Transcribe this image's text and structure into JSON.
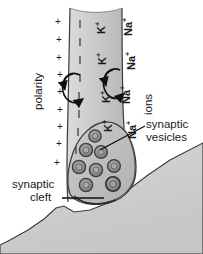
{
  "figure": {
    "type": "biological-diagram"
  },
  "colors": {
    "background": "#ffffff",
    "axon_fill": "#c9c9c9",
    "axon_fill_light": "#e2e2e2",
    "terminal_fill": "#bdbdbd",
    "postsynaptic_fill": "#cfcfcf",
    "outline": "#3a3a3a",
    "vesicle_ring": "#4a4a4a",
    "vesicle_core": "#9a9a9a",
    "text": "#1a1a1a",
    "arrow": "#111111"
  },
  "labels": {
    "polarity": "polarity",
    "ions": "ions",
    "synaptic_vesicles_line1": "synaptic",
    "synaptic_vesicles_line2": "vesicles",
    "synaptic_cleft_line1": "synaptic",
    "synaptic_cleft_line2": "cleft"
  },
  "ion_labels": [
    {
      "base": "K",
      "charge": "+"
    },
    {
      "base": "Na",
      "charge": "+"
    },
    {
      "base": "K",
      "charge": "+"
    },
    {
      "base": "Na",
      "charge": "+"
    },
    {
      "base": "K",
      "charge": "+"
    },
    {
      "base": "Na",
      "charge": "+"
    },
    {
      "base": "K",
      "charge": "+"
    },
    {
      "base": "Na",
      "charge": "+"
    }
  ],
  "ion_text": {
    "k": "K",
    "na": "Na",
    "plus": "+"
  },
  "charges": {
    "outside_symbol": "+",
    "inside_symbol": "|",
    "outside_count": 9,
    "inside_count": 9
  },
  "icons": {
    "polarity_arrow": "circular-arrow-icon",
    "ion_exchange_arrow": "circular-arrow-icon",
    "vesicle": "vesicle-circle-icon",
    "leader_line": "leader-line-icon"
  },
  "vesicles": {
    "count": 8,
    "positions": [
      {
        "cx": 95,
        "cy": 136,
        "r": 6.2
      },
      {
        "cx": 86,
        "cy": 150,
        "r": 6.6
      },
      {
        "cx": 101,
        "cy": 152,
        "r": 6.4
      },
      {
        "cx": 79,
        "cy": 167,
        "r": 6.6
      },
      {
        "cx": 96,
        "cy": 170,
        "r": 6.6
      },
      {
        "cx": 114,
        "cy": 166,
        "r": 6.4
      },
      {
        "cx": 86,
        "cy": 185,
        "r": 6.6
      },
      {
        "cx": 113,
        "cy": 184,
        "r": 7.2
      }
    ]
  }
}
